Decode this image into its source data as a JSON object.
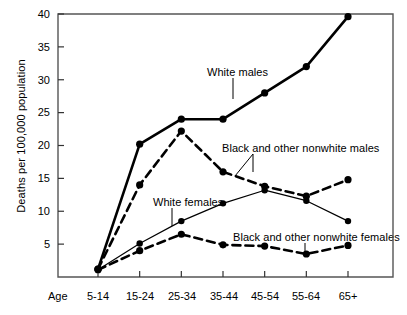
{
  "chart_data": {
    "type": "line",
    "title": "",
    "xlabel": "Age",
    "ylabel": "Deaths per 100,000 population",
    "categories": [
      "5-14",
      "15-24",
      "25-34",
      "35-44",
      "45-54",
      "55-64",
      "65+"
    ],
    "yticks": [
      5,
      10,
      15,
      20,
      25,
      30,
      35,
      40
    ],
    "ylim": [
      0,
      40
    ],
    "grid": false,
    "legend_position": "inline-annotations",
    "series": [
      {
        "name": "White males",
        "style": "solid-thick",
        "marker": "filled-circle",
        "color": "#000000",
        "values": [
          1.2,
          20.2,
          24.0,
          24.0,
          28.0,
          32.0,
          39.6
        ]
      },
      {
        "name": "Black and other nonwhite males",
        "style": "dashed-thick",
        "marker": "filled-circle",
        "color": "#000000",
        "values": [
          1.2,
          14.0,
          22.2,
          16.0,
          13.8,
          12.3,
          14.8
        ]
      },
      {
        "name": "White females",
        "style": "solid-thin",
        "marker": "filled-circle",
        "color": "#000000",
        "values": [
          1.1,
          5.1,
          8.5,
          11.2,
          13.2,
          11.6,
          8.5
        ]
      },
      {
        "name": "Black and other nonwhite females",
        "style": "dashed-thick",
        "marker": "filled-circle",
        "color": "#000000",
        "values": [
          1.1,
          4.0,
          6.5,
          4.9,
          4.7,
          3.5,
          4.8
        ]
      }
    ],
    "annotations": [
      {
        "text": "White males",
        "x": 207,
        "y": 66,
        "leader_x": 233,
        "leader_y1": 78,
        "leader_y2": 99
      },
      {
        "text": "Black and other nonwhite males",
        "x": 222,
        "y": 142,
        "leader_x": 253,
        "leader_y1": 154,
        "leader_y2": 172
      },
      {
        "text": "White females",
        "x": 153,
        "y": 196,
        "leader_x": 172,
        "leader_y1": 208,
        "leader_y2": 226
      },
      {
        "text": "Black and other nonwhite females",
        "x": 233,
        "y": 231,
        "leader_x": 305,
        "leader_y1": 243,
        "leader_y2": 256
      }
    ]
  },
  "axis": {
    "x_axis_title": "Age",
    "y_axis_title": "Deaths per 100,000 population",
    "y_tick_labels": [
      "40",
      "35",
      "30",
      "25",
      "20",
      "15",
      "10",
      "5"
    ],
    "x_tick_labels": [
      "5-14",
      "15-24",
      "25-34",
      "35-44",
      "45-54",
      "55-64",
      "65+"
    ]
  }
}
